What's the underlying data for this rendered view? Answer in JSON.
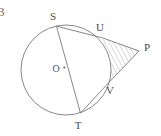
{
  "figure": {
    "kind": "geometry-diagram",
    "caption_number": "3",
    "background_color": "#ffffff",
    "stroke_color": "#7a7a7a",
    "hatch_color": "#8a8a8a",
    "label_color": "#4a4a4a",
    "labels": {
      "center": "O",
      "top_point": "S",
      "bottom_point": "T",
      "upper_tangency": "U",
      "lower_tangency": "V",
      "external_point": "P"
    },
    "geometry": {
      "circle": {
        "cx": 66,
        "cy": 70,
        "r": 45
      },
      "points": {
        "S": {
          "x": 56.5,
          "y": 26.2
        },
        "T": {
          "x": 80.5,
          "y": 113.2
        },
        "U": {
          "x": 103.0,
          "y": 38.0
        },
        "V": {
          "x": 106.5,
          "y": 85.0
        },
        "P": {
          "x": 139.0,
          "y": 51.0
        },
        "O": {
          "x": 66,
          "y": 70
        }
      },
      "segments": [
        {
          "name": "diameter-ST",
          "from": "S",
          "to": "T"
        },
        {
          "name": "chord-SU",
          "from": "S",
          "to": "U"
        },
        {
          "name": "chord-TV",
          "from": "T",
          "to": "V"
        },
        {
          "name": "tangent-UP",
          "from": "U",
          "to": "P"
        },
        {
          "name": "tangent-VP",
          "from": "V",
          "to": "P"
        }
      ],
      "hatched_region": "region bounded by tangent UP, tangent VP and minor arc UV"
    },
    "label_positions": {
      "S": {
        "x": 53,
        "y": 20
      },
      "U": {
        "x": 100,
        "y": 31
      },
      "P": {
        "x": 144,
        "y": 50
      },
      "V": {
        "x": 110,
        "y": 94
      },
      "T": {
        "x": 78,
        "y": 128
      },
      "O": {
        "x": 53,
        "y": 73
      },
      "number": {
        "x": 0,
        "y": 15
      }
    }
  }
}
